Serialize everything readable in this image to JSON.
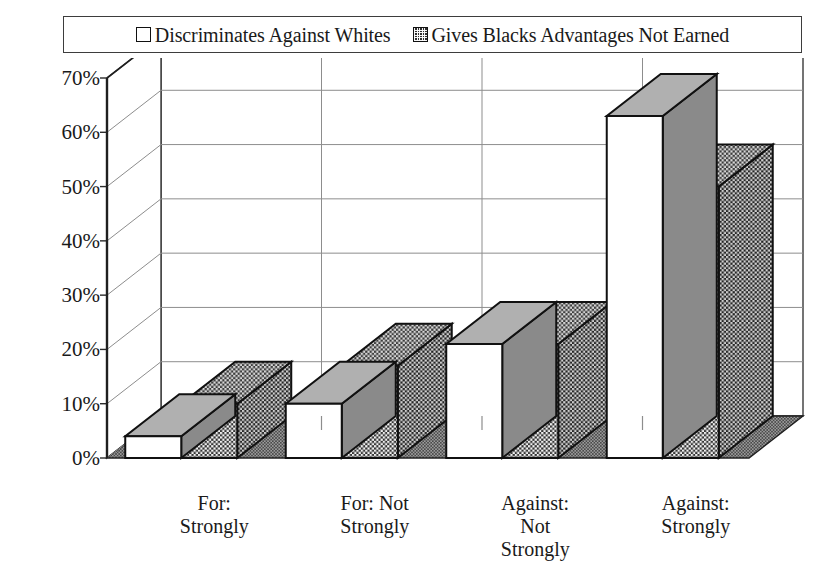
{
  "title_remnant": "",
  "legend": {
    "position": "top",
    "entries": [
      {
        "label": "Discriminates Against Whites",
        "swatch": "white-square-icon",
        "style": "series-white"
      },
      {
        "label": "Gives Blacks Advantages Not Earned",
        "swatch": "dark-checkered-square-icon",
        "style": "series-dark"
      }
    ]
  },
  "axes": {
    "y_ticks": [
      "0%",
      "10%",
      "20%",
      "30%",
      "40%",
      "50%",
      "60%",
      "70%"
    ],
    "x_categories": [
      "For:\nStrongly",
      "For: Not\nStrongly",
      "Against:\nNot\nStrongly",
      "Against:\nStrongly"
    ]
  },
  "colors": {
    "series_white_face": "#ffffff",
    "series_white_top": "#b0b0b0",
    "series_white_side": "#8a8a8a",
    "series_dark_face": "#3a3a3a",
    "series_dark_top": "#4a4a4a",
    "series_dark_side": "#2c2c2c",
    "outline": "#111111",
    "gridline": "#8d8d8d",
    "floor": "#4e4e4e",
    "wall": "#ffffff"
  },
  "chart_data": {
    "type": "bar",
    "title": "",
    "xlabel": "",
    "ylabel": "",
    "ylim": [
      0,
      70
    ],
    "ytick_step": 10,
    "grid": true,
    "legend_position": "top",
    "three_d": true,
    "categories": [
      "For: Strongly",
      "For: Not Strongly",
      "Against: Not Strongly",
      "Against: Strongly"
    ],
    "series": [
      {
        "name": "Discriminates Against Whites",
        "values": [
          4,
          10,
          21,
          63
        ]
      },
      {
        "name": "Gives Blacks Advantages Not Earned",
        "values": [
          10,
          17,
          21,
          50
        ]
      }
    ]
  }
}
